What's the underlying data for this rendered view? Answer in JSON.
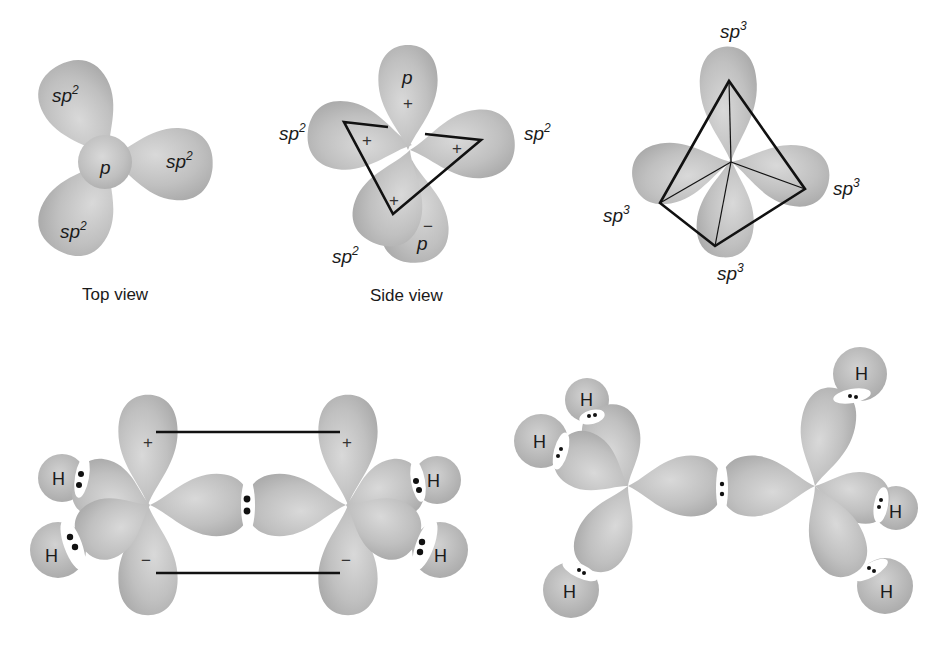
{
  "colors": {
    "lobe": "#bdbdbd",
    "lobe_light": "#d6d6d6",
    "lobe_dark": "#a9a9a9",
    "ink": "#111111",
    "background": "#ffffff"
  },
  "panels": {
    "top_view": {
      "caption": "Top view",
      "center_label": "p",
      "lobe_labels": [
        {
          "base": "sp",
          "sup": "2"
        },
        {
          "base": "sp",
          "sup": "2"
        },
        {
          "base": "sp",
          "sup": "2"
        }
      ]
    },
    "side_view": {
      "caption": "Side view",
      "p_top": {
        "base": "p",
        "sign": "+"
      },
      "p_bottom": {
        "base": "p",
        "sign": "−"
      },
      "lobe_labels": [
        {
          "base": "sp",
          "sup": "2"
        },
        {
          "base": "sp",
          "sup": "2"
        },
        {
          "base": "sp",
          "sup": "2"
        }
      ],
      "lobe_signs": [
        "+",
        "+",
        "+"
      ]
    },
    "tetrahedral": {
      "lobe_labels": [
        {
          "base": "sp",
          "sup": "3"
        },
        {
          "base": "sp",
          "sup": "3"
        },
        {
          "base": "sp",
          "sup": "3"
        },
        {
          "base": "sp",
          "sup": "3"
        }
      ]
    },
    "ethylene": {
      "atoms": [
        "H",
        "H",
        "H",
        "H"
      ],
      "p_signs": {
        "upper_left": "+",
        "upper_right": "+",
        "lower_left": "−",
        "lower_right": "−"
      }
    },
    "ethane": {
      "atoms": [
        "H",
        "H",
        "H",
        "H",
        "H",
        "H"
      ]
    }
  }
}
